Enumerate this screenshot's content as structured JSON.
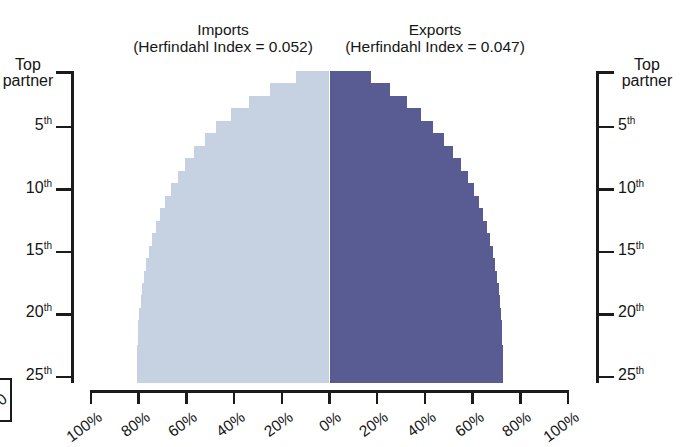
{
  "figure": {
    "cut_off_caption_top": "",
    "imports": {
      "title": "Imports",
      "subtitle": "(Herfindahl Index = 0.052)",
      "herfindahl_index": 0.052,
      "color": "#c6d2e2"
    },
    "exports": {
      "title": "Exports",
      "subtitle": "(Herfindahl Index = 0.047)",
      "herfindahl_index": 0.047,
      "color": "#585c92"
    },
    "left_axis": {
      "top_label_line1": "Top",
      "top_label_line2": "partner",
      "ticks": [
        "5",
        "10",
        "15",
        "20",
        "25"
      ],
      "tick_suffix": "th"
    },
    "right_axis": {
      "top_label_line1": "Top",
      "top_label_line2": "partner",
      "ticks": [
        "5",
        "10",
        "15",
        "20",
        "25"
      ],
      "tick_suffix": "th"
    },
    "x_axis": {
      "left_ticks": [
        "100%",
        "80%",
        "60%",
        "40%",
        "20%",
        "0%"
      ],
      "right_ticks": [
        "0%",
        "20%",
        "40%",
        "60%",
        "80%",
        "100%"
      ],
      "edge_cut_label": "0"
    }
  },
  "chart_data": {
    "type": "bar",
    "orientation": "horizontal-diverging",
    "title": "",
    "subtitle": "",
    "xlabel": "",
    "ylabel": "",
    "xlim": [
      -100,
      100
    ],
    "grid": false,
    "legend_position": "above-panels",
    "categories": [
      "Top partner",
      "2nd",
      "3rd",
      "4th",
      "5th",
      "6th",
      "7th",
      "8th",
      "9th",
      "10th",
      "11th",
      "12th",
      "13th",
      "14th",
      "15th",
      "16th",
      "17th",
      "18th",
      "19th",
      "20th",
      "21st",
      "22nd",
      "23rd",
      "24th",
      "25th"
    ],
    "series": [
      {
        "name": "Imports",
        "color": "#c6d2e2",
        "direction": "left",
        "description": "Cumulative share of total imports accounted for by the top N trading partners",
        "values": [
          13.9,
          25.1,
          33.9,
          41.2,
          47.4,
          52.4,
          56.7,
          60.5,
          63.6,
          66.4,
          68.8,
          70.9,
          72.7,
          74.3,
          75.6,
          76.8,
          77.8,
          78.6,
          79.2,
          79.7,
          80.1,
          80.4,
          80.6,
          80.8,
          80.9
        ]
      },
      {
        "name": "Exports",
        "color": "#585c92",
        "direction": "right",
        "description": "Cumulative share of total exports accounted for by the top N trading partners",
        "values": [
          17.2,
          25.5,
          32.4,
          38.4,
          43.5,
          47.9,
          51.7,
          55.0,
          57.9,
          60.4,
          62.6,
          64.4,
          66.0,
          67.4,
          68.6,
          69.6,
          70.4,
          71.1,
          71.6,
          72.0,
          72.3,
          72.5,
          72.6,
          72.7,
          72.8
        ]
      }
    ]
  }
}
